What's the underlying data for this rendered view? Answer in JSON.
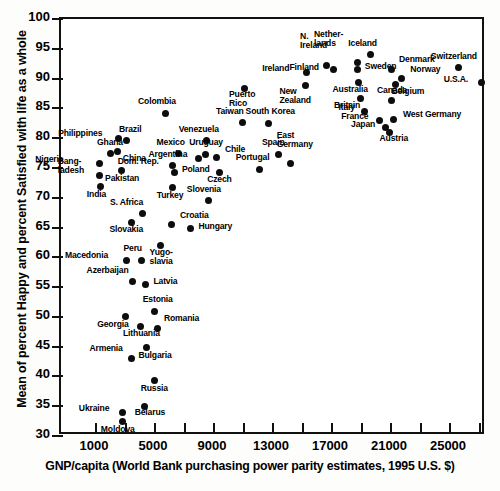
{
  "chart_data": {
    "type": "scatter",
    "title": "",
    "xlabel": "GNP/capita (World Bank purchasing power parity estimates, 1995 U.S. $)",
    "ylabel": "Mean of percent Happy and percent Satisfied with life as a whole",
    "xlim": [
      0,
      28000
    ],
    "ylim": [
      30,
      100
    ],
    "xticks": [
      1000,
      3000,
      5000,
      7000,
      9000,
      11000,
      13000,
      15000,
      17000,
      19000,
      21000,
      23000,
      25000,
      27000
    ],
    "xticklabels": [
      "1000",
      "",
      "5000",
      "",
      "9000",
      "",
      "13000",
      "",
      "17000",
      "",
      "21000",
      "",
      "25000",
      ""
    ],
    "yticks": [
      30,
      35,
      40,
      45,
      50,
      55,
      60,
      65,
      70,
      75,
      80,
      85,
      90,
      95,
      100
    ],
    "yticklabels": [
      "30",
      "35",
      "40",
      "45",
      "50",
      "55",
      "60",
      "65",
      "70",
      "75",
      "80",
      "85",
      "90",
      "95",
      "100"
    ],
    "grid": false,
    "legend": null,
    "marker_color": "#0d0d0d",
    "points": [
      {
        "name": "Nigeria",
        "x": 1220,
        "y": 75.8,
        "lx": -64,
        "ly": -4
      },
      {
        "name": "Bang-\nladesh",
        "x": 1250,
        "y": 73.8,
        "lx": -42,
        "ly": -5
      },
      {
        "name": "India",
        "x": 1330,
        "y": 71.8,
        "lx": -14,
        "ly": 7
      },
      {
        "name": "Ghana",
        "x": 1950,
        "y": 77.4,
        "lx": -13,
        "ly": -12
      },
      {
        "name": "Philippines",
        "x": 2500,
        "y": 79.9,
        "lx": -60,
        "ly": -6
      },
      {
        "name": "China",
        "x": 2480,
        "y": 77.7,
        "lx": 5,
        "ly": 6
      },
      {
        "name": "Pakistan",
        "x": 2700,
        "y": 74.5,
        "lx": -16,
        "ly": 7
      },
      {
        "name": "Brazil",
        "x": 3100,
        "y": 79.6,
        "lx": -8,
        "ly": -12
      },
      {
        "name": "S. Africa",
        "x": 4180,
        "y": 67.3,
        "lx": -33,
        "ly": -12
      },
      {
        "name": "Slovakia",
        "x": 3400,
        "y": 65.9,
        "lx": -22,
        "ly": 7
      },
      {
        "name": "Macedonia",
        "x": 3100,
        "y": 59.5,
        "lx": -62,
        "ly": -5
      },
      {
        "name": "Peru",
        "x": 4080,
        "y": 59.5,
        "lx": -18,
        "ly": -12
      },
      {
        "name": "Azerbaijan",
        "x": 3480,
        "y": 56.0,
        "lx": -46,
        "ly": -11
      },
      {
        "name": "Latvia",
        "x": 4350,
        "y": 55.4,
        "lx": 8,
        "ly": -4
      },
      {
        "name": "Georgia",
        "x": 2980,
        "y": 50.0,
        "lx": -28,
        "ly": 7
      },
      {
        "name": "Lithuania",
        "x": 4050,
        "y": 48.4,
        "lx": -18,
        "ly": 7
      },
      {
        "name": "Estonia",
        "x": 4980,
        "y": 50.9,
        "lx": -12,
        "ly": -12
      },
      {
        "name": "Romania",
        "x": 5200,
        "y": 48.0,
        "lx": 6,
        "ly": -11
      },
      {
        "name": "Armenia",
        "x": 3400,
        "y": 43.0,
        "lx": -42,
        "ly": -11
      },
      {
        "name": "Bulgaria",
        "x": 4420,
        "y": 44.8,
        "lx": -8,
        "ly": 7
      },
      {
        "name": "Russia",
        "x": 4980,
        "y": 39.3,
        "lx": -14,
        "ly": 7
      },
      {
        "name": "Ukraine",
        "x": 2820,
        "y": 33.9,
        "lx": -44,
        "ly": -5
      },
      {
        "name": "Belarus",
        "x": 4300,
        "y": 35.0,
        "lx": -10,
        "ly": 6
      },
      {
        "name": "Moldova",
        "x": 2820,
        "y": 32.4,
        "lx": -22,
        "ly": 7
      },
      {
        "name": "Colombia",
        "x": 5680,
        "y": 84.2,
        "lx": -27,
        "ly": -12
      },
      {
        "name": "Mexico",
        "x": 6600,
        "y": 77.4,
        "lx": -22,
        "ly": -12
      },
      {
        "name": "Dom. Rep.",
        "x": 6200,
        "y": 75.4,
        "lx": -55,
        "ly": -5
      },
      {
        "name": "Poland",
        "x": 6350,
        "y": 74.2,
        "lx": 7,
        "ly": -4
      },
      {
        "name": "Turkey",
        "x": 6200,
        "y": 71.7,
        "lx": -16,
        "ly": 7
      },
      {
        "name": "Croatia",
        "x": 6150,
        "y": 65.5,
        "lx": 8,
        "ly": -10
      },
      {
        "name": "Yugo-\nslavia",
        "x": 5380,
        "y": 61.9,
        "lx": -11,
        "ly": 6
      },
      {
        "name": "Hungary",
        "x": 7400,
        "y": 64.8,
        "lx": 8,
        "ly": -3
      },
      {
        "name": "Slovenia",
        "x": 8650,
        "y": 69.5,
        "lx": -22,
        "ly": -12
      },
      {
        "name": "Venezuela",
        "x": 8500,
        "y": 79.6,
        "lx": -28,
        "ly": -12
      },
      {
        "name": "Uruguay",
        "x": 8400,
        "y": 77.3,
        "lx": -16,
        "ly": -12
      },
      {
        "name": "Argentina",
        "x": 7950,
        "y": 76.5,
        "lx": -50,
        "ly": -5
      },
      {
        "name": "Chile",
        "x": 9200,
        "y": 76.7,
        "lx": 8,
        "ly": -9
      },
      {
        "name": "Czech",
        "x": 9350,
        "y": 74.3,
        "lx": -12,
        "ly": 7
      },
      {
        "name": "Taiwan",
        "x": 10900,
        "y": 82.6,
        "lx": -26,
        "ly": -12
      },
      {
        "name": "South Korea",
        "x": 12700,
        "y": 82.5,
        "lx": -23,
        "ly": -12
      },
      {
        "name": "Puerto\nRico",
        "x": 11100,
        "y": 88.4,
        "lx": -16,
        "ly": 6
      },
      {
        "name": "Portugal",
        "x": 12100,
        "y": 74.8,
        "lx": -24,
        "ly": -12
      },
      {
        "name": "Spain",
        "x": 13400,
        "y": 77.3,
        "lx": -17,
        "ly": -12
      },
      {
        "name": "East\nGermany",
        "x": 14200,
        "y": 75.7,
        "lx": -14,
        "ly": -20
      },
      {
        "name": "Ireland",
        "x": 15250,
        "y": 91.0,
        "lx": -44,
        "ly": -5
      },
      {
        "name": "New\nZealand",
        "x": 15200,
        "y": 88.9,
        "lx": -26,
        "ly": 6
      },
      {
        "name": "N.\nIreland",
        "x": 16600,
        "y": 92.2,
        "lx": -26,
        "ly": -20
      },
      {
        "name": "Finland",
        "x": 17100,
        "y": 91.6,
        "lx": -44,
        "ly": -2
      },
      {
        "name": "Nether-\nlands",
        "x": 18700,
        "y": 92.7,
        "lx": -43,
        "ly": -19
      },
      {
        "name": "Sweden",
        "x": 18750,
        "y": 91.5,
        "lx": 7,
        "ly": -4
      },
      {
        "name": "Iceland",
        "x": 19600,
        "y": 94.0,
        "lx": -22,
        "ly": -12
      },
      {
        "name": "Australia",
        "x": 18800,
        "y": 89.3,
        "lx": -26,
        "ly": 6
      },
      {
        "name": "Britain",
        "x": 18900,
        "y": 86.6,
        "lx": -26,
        "ly": 6
      },
      {
        "name": "Denmark",
        "x": 21000,
        "y": 91.6,
        "lx": 8,
        "ly": -10
      },
      {
        "name": "Norway",
        "x": 21700,
        "y": 90.0,
        "lx": 9,
        "ly": -10
      },
      {
        "name": "Belgium",
        "x": 21300,
        "y": 89.0,
        "lx": -4,
        "ly": 6
      },
      {
        "name": "Canada",
        "x": 21000,
        "y": 86.3,
        "lx": -14,
        "ly": -11
      },
      {
        "name": "Italy",
        "x": 19200,
        "y": 84.5,
        "lx": -26,
        "ly": -4
      },
      {
        "name": "West Germany",
        "x": 21200,
        "y": 83.2,
        "lx": 9,
        "ly": -5
      },
      {
        "name": "France",
        "x": 20200,
        "y": 83.0,
        "lx": -38,
        "ly": -4
      },
      {
        "name": "Japan",
        "x": 20600,
        "y": 81.8,
        "lx": -34,
        "ly": -3
      },
      {
        "name": "Austria",
        "x": 20900,
        "y": 81.0,
        "lx": -10,
        "ly": 6
      },
      {
        "name": "Switzerland",
        "x": 25600,
        "y": 91.8,
        "lx": -28,
        "ly": -12
      },
      {
        "name": "U.S.A.",
        "x": 27150,
        "y": 89.3,
        "lx": -38,
        "ly": -4
      }
    ]
  }
}
